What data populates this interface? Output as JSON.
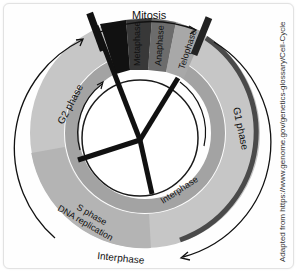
{
  "diagram": {
    "title": "Mitosis",
    "phases": {
      "mitosis_sub": [
        "Prophase",
        "Metaphase",
        "Anaphase",
        "Telophase"
      ],
      "g1": "G1 phase",
      "g2": "G2 phase",
      "s_line1": "S phase",
      "s_line2": "DNA replication",
      "interphase_inner": "Interphase",
      "interphase_outer": "Interphase"
    },
    "credit": "Adapted from https://www.genome.gov/genetics-glossary/Cell-Cycle",
    "colors": {
      "prophase": "#111111",
      "metaphase": "#3a3a3a",
      "anaphase": "#6e6e6e",
      "telophase": "#a9a9a9",
      "ring_outer": "#c4c4c4",
      "ring_inner": "#9c9c9c",
      "g1_edge": "#4a4a4a"
    }
  }
}
